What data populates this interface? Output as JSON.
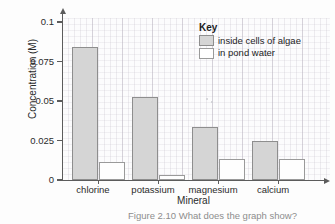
{
  "chart_data": {
    "type": "bar",
    "title": "",
    "xlabel": "Mineral",
    "ylabel": "Concentration (M)",
    "categories": [
      "chlorine",
      "potassium",
      "magnesium",
      "calcium"
    ],
    "series": [
      {
        "name": "inside cells of algae",
        "values": [
          0.082,
          0.051,
          0.033,
          0.024
        ],
        "color": "#d5d5d5"
      },
      {
        "name": "in pond water",
        "values": [
          0.011,
          0.003,
          0.013,
          0.013
        ],
        "color": "#ffffff"
      }
    ],
    "ylim": [
      0,
      0.1
    ],
    "yticks": [
      0,
      0.025,
      0.05,
      0.075,
      0.1
    ],
    "ytick_labels": [
      "0",
      "0.025",
      "0.05",
      "0.075",
      "0.1"
    ],
    "grid": true,
    "legend_position": "top-right"
  },
  "legend": {
    "title": "Key",
    "entries": [
      {
        "label": "inside cells of algae"
      },
      {
        "label": "in pond water"
      }
    ]
  },
  "caption": {
    "text": "Figure 2.10 What does the graph show?"
  }
}
